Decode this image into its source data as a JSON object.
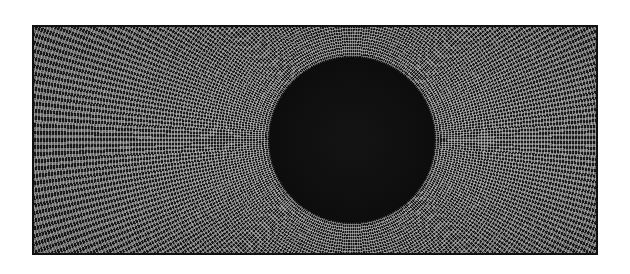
{
  "artwork": {
    "description": "Black disc centered within a rectangular field of radiating dashed white strokes on dark ground",
    "colors": {
      "background": "#ffffff",
      "field": "#2a2a2a",
      "strokes": "#d8d8d8",
      "disc": "#0d0d0d",
      "border": "#111111"
    }
  }
}
